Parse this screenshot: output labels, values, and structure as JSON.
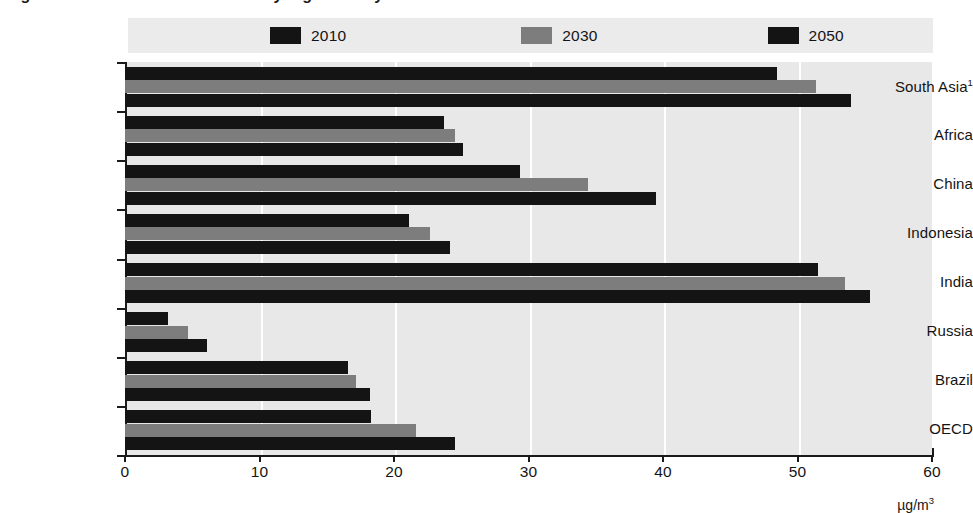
{
  "figure": {
    "title": "Figure 1. Concentration of PM2.5 by region and year",
    "title_visible": false
  },
  "legend": {
    "position": "top",
    "items": [
      {
        "label": "2010",
        "color": "#141414",
        "icon": "legend-swatch"
      },
      {
        "label": "2030",
        "color": "#7d7d7d",
        "icon": "legend-swatch"
      },
      {
        "label": "2050",
        "color": "#141414",
        "icon": "legend-swatch"
      }
    ]
  },
  "axis": {
    "x_unit": "µg/m",
    "x_unit_exponent": "3",
    "x_ticks": [
      "0",
      "10",
      "20",
      "30",
      "40",
      "50",
      "60"
    ]
  },
  "footnote_marker": "1",
  "chart_data": {
    "type": "bar",
    "orientation": "horizontal",
    "title": "",
    "xlabel": "µg/m3",
    "ylabel": "",
    "xlim": [
      0,
      60
    ],
    "grid": true,
    "legend_position": "top",
    "categories": [
      "South Asia¹",
      "Africa",
      "China",
      "Indonesia",
      "India",
      "Russia",
      "Brazil",
      "OECD"
    ],
    "series": [
      {
        "name": "2010",
        "color": "#141414",
        "values": [
          48.5,
          23.7,
          29.4,
          21.1,
          51.5,
          3.2,
          16.6,
          18.3
        ]
      },
      {
        "name": "2030",
        "color": "#7d7d7d",
        "values": [
          51.4,
          24.5,
          34.4,
          22.7,
          53.5,
          4.7,
          17.2,
          21.6
        ]
      },
      {
        "name": "2050",
        "color": "#141414",
        "values": [
          54.0,
          25.1,
          39.5,
          24.2,
          55.4,
          6.1,
          18.2,
          24.5
        ]
      }
    ]
  }
}
